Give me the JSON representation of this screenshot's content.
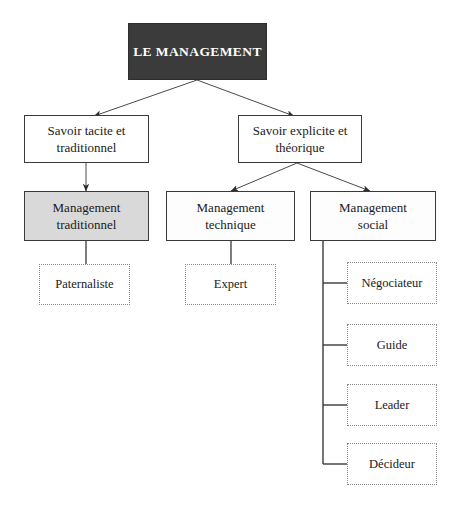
{
  "diagram": {
    "title": "LE MANAGEMENT",
    "colors": {
      "root_fill": "#3b3b3b",
      "root_text": "#ffffff",
      "shaded_fill": "#d9d9d9",
      "plain_fill": "#ffffff",
      "border": "#3a3a3a",
      "leaf_border": "#8a8a8a",
      "connector": "#4a4a4a",
      "background": "#ffffff"
    },
    "nodes": {
      "root": {
        "label": "LE MANAGEMENT"
      },
      "level2": [
        {
          "label": "Savoir tacite et\ntraditionnel"
        },
        {
          "label": "Savoir explicite et\nthéorique"
        }
      ],
      "level3": [
        {
          "label": "Management\ntraditionnel",
          "shaded": true
        },
        {
          "label": "Management\ntechnique",
          "shaded": false
        },
        {
          "label": "Management\nsocial",
          "shaded": false
        }
      ],
      "leaves": [
        {
          "label": "Paternaliste"
        },
        {
          "label": "Expert"
        },
        {
          "label": "Négociateur"
        },
        {
          "label": "Guide"
        },
        {
          "label": "Leader"
        },
        {
          "label": "Décideur"
        }
      ]
    }
  }
}
